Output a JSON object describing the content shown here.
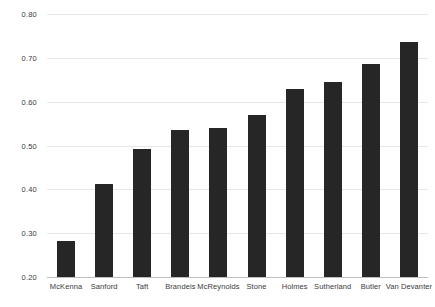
{
  "chart_data": {
    "type": "bar",
    "title": "",
    "subtitle": "",
    "xlabel": "",
    "ylabel": "",
    "categories": [
      "McKenna",
      "Sanford",
      "Taft",
      "Brandeis",
      "McReynolds",
      "Stone",
      "Holmes",
      "Sutherland",
      "Butler",
      "Van Devanter"
    ],
    "values": [
      0.283,
      0.413,
      0.493,
      0.535,
      0.541,
      0.57,
      0.628,
      0.645,
      0.686,
      0.736
    ],
    "ylim": [
      0.2,
      0.8
    ],
    "yticks": [
      0.2,
      0.3,
      0.4,
      0.5,
      0.6,
      0.7,
      0.8
    ],
    "ytick_labels": [
      "0.20",
      "0.30",
      "0.40",
      "0.50",
      "0.60",
      "0.70",
      "0.80"
    ],
    "grid": true,
    "legend": false,
    "legend_position": "none",
    "bar_color": "#262626",
    "gridline_color": "#e6e6e6",
    "axis_color": "#bdbdbd",
    "tick_label_color": "#3a3a3a"
  }
}
